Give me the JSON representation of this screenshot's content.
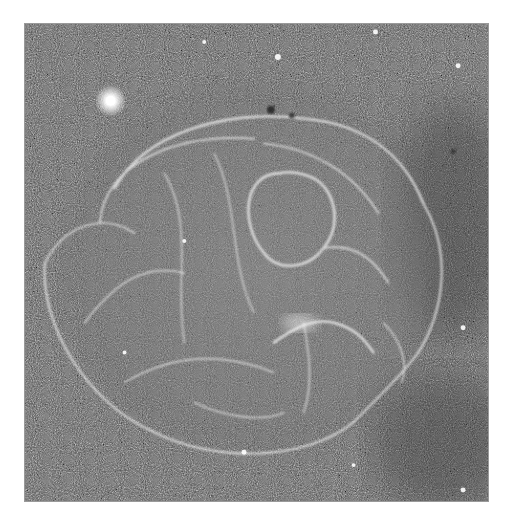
{
  "image": {
    "subject": "supernova remnant nebula in a dense star field",
    "mode": "grayscale",
    "frame": {
      "x": 24,
      "y": 23,
      "width": 465,
      "height": 479,
      "border_color": "#9a9a9a"
    },
    "background_color": "#555555",
    "page_background": "#ffffff",
    "features": [
      {
        "name": "bright-star",
        "x": 110,
        "y": 100,
        "radius": 9
      },
      {
        "name": "nebula-shell",
        "cx": 255,
        "cy": 265,
        "rx": 200,
        "ry": 185
      },
      {
        "name": "inner-loop",
        "cx": 278,
        "cy": 200,
        "rx": 42,
        "ry": 45
      },
      {
        "name": "bright-knot",
        "x": 300,
        "y": 322
      }
    ]
  }
}
